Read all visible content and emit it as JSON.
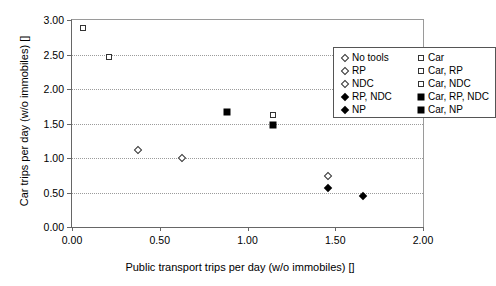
{
  "chart_data": {
    "type": "scatter",
    "title": "",
    "xlabel": "Public transport trips per day (w/o immobiles) []",
    "ylabel": "Car trips per day (w/o immobiles) []",
    "xlim": [
      0.0,
      2.0
    ],
    "ylim": [
      0.0,
      3.0
    ],
    "xticks": [
      "0.00",
      "0.50",
      "1.00",
      "1.50",
      "2.00"
    ],
    "xtick_values": [
      0.0,
      0.5,
      1.0,
      1.5,
      2.0
    ],
    "yticks": [
      "0.00",
      "0.50",
      "1.00",
      "1.50",
      "2.00",
      "2.50",
      "3.00"
    ],
    "ytick_values": [
      0.0,
      0.5,
      1.0,
      1.5,
      2.0,
      2.5,
      3.0
    ],
    "grid": "horizontal-dotted",
    "legend_position": "top-right-inside",
    "series": [
      {
        "name": "No tools",
        "marker": "diamond-open",
        "x": 0.625,
        "y": 1.0
      },
      {
        "name": "RP",
        "marker": "diamond-open",
        "x": 0.375,
        "y": 1.11
      },
      {
        "name": "NDC",
        "marker": "diamond-open",
        "x": 1.46,
        "y": 0.74
      },
      {
        "name": "RP, NDC",
        "marker": "diamond-filled",
        "x": 1.46,
        "y": 0.57
      },
      {
        "name": "NP",
        "marker": "diamond-filled",
        "x": 1.66,
        "y": 0.45
      },
      {
        "name": "Car",
        "marker": "square-open",
        "x": 0.06,
        "y": 2.88
      },
      {
        "name": "Car, RP",
        "marker": "square-open",
        "x": 0.21,
        "y": 2.46
      },
      {
        "name": "Car, NDC",
        "marker": "square-open",
        "x": 1.145,
        "y": 1.63
      },
      {
        "name": "Car, RP, NDC",
        "marker": "square-filled",
        "x": 1.145,
        "y": 1.48
      },
      {
        "name": "Car, NP",
        "marker": "square-filled",
        "x": 0.885,
        "y": 1.665
      }
    ],
    "legend": {
      "left_column": [
        {
          "label": "No tools",
          "marker": "diamond-open"
        },
        {
          "label": "RP",
          "marker": "diamond-open"
        },
        {
          "label": "NDC",
          "marker": "diamond-open"
        },
        {
          "label": "RP, NDC",
          "marker": "diamond-filled"
        },
        {
          "label": "NP",
          "marker": "diamond-filled"
        }
      ],
      "right_column": [
        {
          "label": "Car",
          "marker": "square-open"
        },
        {
          "label": "Car, RP",
          "marker": "square-open"
        },
        {
          "label": "Car, NDC",
          "marker": "square-open"
        },
        {
          "label": "Car, RP, NDC",
          "marker": "square-filled"
        },
        {
          "label": "Car, NP",
          "marker": "square-filled"
        }
      ]
    },
    "colors": {
      "marker_fill": "#000000",
      "marker_open_edge": "#333333",
      "axis": "#666666",
      "grid": "#9b9b9b",
      "background": "#ffffff"
    }
  }
}
